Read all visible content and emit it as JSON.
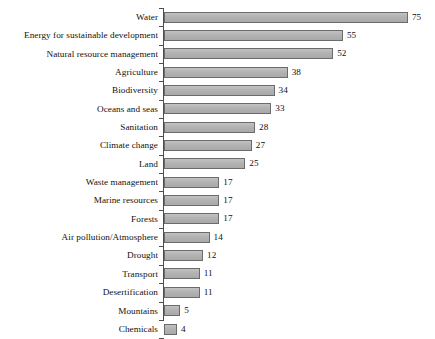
{
  "chart_data": {
    "type": "bar",
    "orientation": "horizontal",
    "title": "",
    "subtitle": "",
    "xlabel": "",
    "ylabel": "",
    "xlim": [
      0,
      75
    ],
    "grid": false,
    "legend": false,
    "data_labels": true,
    "bar_color": "#b4b4b4",
    "bar_edge_color": "#6b6b6b",
    "axis_color": "#4d4d4d",
    "categories": [
      "Water",
      "Energy for sustainable development",
      "Natural resource management",
      "Agriculture",
      "Biodiversity",
      "Oceans and seas",
      "Sanitation",
      "Climate change",
      "Land",
      "Waste management",
      "Marine resources",
      "Forests",
      "Air pollution/Atmosphere",
      "Drought",
      "Transport",
      "Desertification",
      "Mountains",
      "Chemicals"
    ],
    "values": [
      75,
      55,
      52,
      38,
      34,
      33,
      28,
      27,
      25,
      17,
      17,
      17,
      14,
      12,
      11,
      11,
      5,
      4
    ],
    "value_labels": [
      "75",
      "55",
      "52",
      "38",
      "34",
      "33",
      "28",
      "27",
      "25",
      "17",
      "17",
      "17",
      "14",
      "12",
      "11",
      "11",
      "5",
      "4"
    ]
  }
}
